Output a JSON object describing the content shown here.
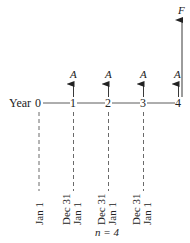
{
  "diagram": {
    "type": "cash-flow-diagram",
    "axis_label": "Year",
    "periods": [
      "0",
      "1",
      "2",
      "3",
      "4"
    ],
    "cash_flow_label": "A",
    "future_value_label": "F",
    "cash_flow_periods": [
      1,
      2,
      3,
      4
    ],
    "dates": [
      {
        "period": 0,
        "labels": [
          "Jan 1"
        ]
      },
      {
        "period": 1,
        "labels": [
          "Dec 31",
          "Jan 1"
        ]
      },
      {
        "period": 2,
        "labels": [
          "Dec 31",
          "Jan 1"
        ]
      },
      {
        "period": 3,
        "labels": [
          "Dec 31",
          "Jan 1"
        ]
      }
    ],
    "n_label": "n = 4"
  }
}
